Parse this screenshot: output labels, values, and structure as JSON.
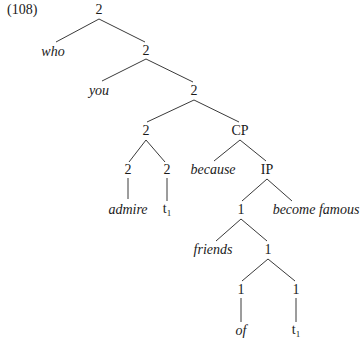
{
  "example_number": "(108)",
  "tree": {
    "nodes": [
      {
        "id": "root",
        "label": "2",
        "italic": false,
        "x": 99,
        "y": 10
      },
      {
        "id": "who",
        "label": "who",
        "italic": true,
        "x": 53,
        "y": 52
      },
      {
        "id": "n2a",
        "label": "2",
        "italic": false,
        "x": 146,
        "y": 51
      },
      {
        "id": "you",
        "label": "you",
        "italic": true,
        "x": 99,
        "y": 91
      },
      {
        "id": "n2b",
        "label": "2",
        "italic": false,
        "x": 194,
        "y": 91
      },
      {
        "id": "n2c",
        "label": "2",
        "italic": false,
        "x": 146,
        "y": 131
      },
      {
        "id": "cp",
        "label": "CP",
        "italic": false,
        "x": 240,
        "y": 131
      },
      {
        "id": "n2d",
        "label": "2",
        "italic": false,
        "x": 128,
        "y": 170
      },
      {
        "id": "n2e",
        "label": "2",
        "italic": false,
        "x": 167,
        "y": 170
      },
      {
        "id": "because",
        "label": "because",
        "italic": true,
        "x": 213,
        "y": 170
      },
      {
        "id": "ip",
        "label": "IP",
        "italic": false,
        "x": 267,
        "y": 170
      },
      {
        "id": "admire",
        "label": "admire",
        "italic": true,
        "x": 128,
        "y": 210
      },
      {
        "id": "t1a",
        "label": "t",
        "sub": "1",
        "italic": false,
        "x": 167,
        "y": 210
      },
      {
        "id": "n1a",
        "label": "1",
        "italic": false,
        "x": 241,
        "y": 210
      },
      {
        "id": "become",
        "label": "become famous",
        "italic": true,
        "x": 316,
        "y": 210
      },
      {
        "id": "friends",
        "label": "friends",
        "italic": true,
        "x": 213,
        "y": 250
      },
      {
        "id": "n1b",
        "label": "1",
        "italic": false,
        "x": 268,
        "y": 250
      },
      {
        "id": "n1c",
        "label": "1",
        "italic": false,
        "x": 241,
        "y": 290
      },
      {
        "id": "n1d",
        "label": "1",
        "italic": false,
        "x": 296,
        "y": 290
      },
      {
        "id": "of",
        "label": "of",
        "italic": true,
        "x": 241,
        "y": 331
      },
      {
        "id": "t1b",
        "label": "t",
        "sub": "1",
        "italic": false,
        "x": 296,
        "y": 331
      }
    ],
    "edges": [
      {
        "from": "root",
        "to": "who",
        "x1": 99,
        "y1": 19,
        "x2": 56,
        "y2": 42
      },
      {
        "from": "root",
        "to": "n2a",
        "x1": 99,
        "y1": 19,
        "x2": 145,
        "y2": 42
      },
      {
        "from": "n2a",
        "to": "you",
        "x1": 146,
        "y1": 59,
        "x2": 102,
        "y2": 81
      },
      {
        "from": "n2a",
        "to": "n2b",
        "x1": 146,
        "y1": 59,
        "x2": 193,
        "y2": 82
      },
      {
        "from": "n2b",
        "to": "n2c",
        "x1": 194,
        "y1": 100,
        "x2": 147,
        "y2": 122
      },
      {
        "from": "n2b",
        "to": "cp",
        "x1": 194,
        "y1": 100,
        "x2": 239,
        "y2": 122
      },
      {
        "from": "n2c",
        "to": "n2d",
        "x1": 146,
        "y1": 140,
        "x2": 129,
        "y2": 162
      },
      {
        "from": "n2c",
        "to": "n2e",
        "x1": 146,
        "y1": 140,
        "x2": 165,
        "y2": 162
      },
      {
        "from": "cp",
        "to": "because",
        "x1": 240,
        "y1": 140,
        "x2": 214,
        "y2": 161
      },
      {
        "from": "cp",
        "to": "ip",
        "x1": 240,
        "y1": 140,
        "x2": 266,
        "y2": 161
      },
      {
        "from": "n2d",
        "to": "admire",
        "x1": 128,
        "y1": 178,
        "x2": 128,
        "y2": 199
      },
      {
        "from": "n2e",
        "to": "t1a",
        "x1": 167,
        "y1": 178,
        "x2": 167,
        "y2": 201
      },
      {
        "from": "ip",
        "to": "n1a",
        "x1": 267,
        "y1": 179,
        "x2": 242,
        "y2": 201
      },
      {
        "from": "ip",
        "to": "become",
        "x1": 267,
        "y1": 179,
        "x2": 292,
        "y2": 201
      },
      {
        "from": "n1a",
        "to": "friends",
        "x1": 241,
        "y1": 219,
        "x2": 216,
        "y2": 241
      },
      {
        "from": "n1a",
        "to": "n1b",
        "x1": 241,
        "y1": 219,
        "x2": 267,
        "y2": 241
      },
      {
        "from": "n1b",
        "to": "n1c",
        "x1": 268,
        "y1": 259,
        "x2": 242,
        "y2": 281
      },
      {
        "from": "n1b",
        "to": "n1d",
        "x1": 268,
        "y1": 259,
        "x2": 295,
        "y2": 281
      },
      {
        "from": "n1c",
        "to": "of",
        "x1": 241,
        "y1": 298,
        "x2": 241,
        "y2": 322
      },
      {
        "from": "n1d",
        "to": "t1b",
        "x1": 296,
        "y1": 298,
        "x2": 296,
        "y2": 322
      }
    ]
  },
  "colors": {
    "ink": "#1a1a1a",
    "line": "#3a3a3a",
    "background": "#ffffff"
  }
}
